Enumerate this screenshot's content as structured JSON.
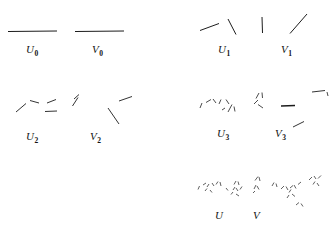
{
  "figure": {
    "title": "",
    "background_color": "#ffffff",
    "ink_color": "#1c1c1c",
    "width": 335,
    "height": 232
  },
  "panels": [
    {
      "id": "u0",
      "label": "U",
      "subscript": "0",
      "label_x": 26,
      "label_y": 44,
      "column": "left",
      "row": 0,
      "segment_count": 1,
      "segments": [
        {
          "x1": 8,
          "y1": 31.5,
          "x2": 57,
          "y2": 31.0,
          "w": 1.1
        }
      ]
    },
    {
      "id": "v0",
      "label": "V",
      "subscript": "0",
      "label_x": 92,
      "label_y": 44,
      "column": "left",
      "row": 0,
      "segment_count": 1,
      "segments": [
        {
          "x1": 75,
          "y1": 31.5,
          "x2": 124,
          "y2": 31.0,
          "w": 1.1
        }
      ]
    },
    {
      "id": "u1",
      "label": "U",
      "subscript": "1",
      "label_x": 218,
      "label_y": 44,
      "column": "right",
      "row": 0,
      "segment_count": 2,
      "segments": [
        {
          "x1": 200,
          "y1": 30.5,
          "x2": 219,
          "y2": 23.5,
          "w": 1.0
        },
        {
          "x1": 228,
          "y1": 19.0,
          "x2": 236,
          "y2": 34.5,
          "w": 1.0
        }
      ]
    },
    {
      "id": "v1",
      "label": "V",
      "subscript": "1",
      "label_x": 281,
      "label_y": 44,
      "column": "right",
      "row": 0,
      "segment_count": 2,
      "segments": [
        {
          "x1": 262,
          "y1": 17.0,
          "x2": 262.5,
          "y2": 33.0,
          "w": 1.0
        },
        {
          "x1": 290,
          "y1": 33.5,
          "x2": 307,
          "y2": 14.0,
          "w": 1.0
        }
      ]
    },
    {
      "id": "u2",
      "label": "U",
      "subscript": "2",
      "label_x": 26,
      "label_y": 131,
      "column": "left",
      "row": 1,
      "segment_count": 4,
      "segments": [
        {
          "x1": 16,
          "y1": 112.0,
          "x2": 26,
          "y2": 103.5,
          "w": 0.9
        },
        {
          "x1": 30,
          "y1": 100.5,
          "x2": 39,
          "y2": 103.0,
          "w": 0.9
        },
        {
          "x1": 47,
          "y1": 103.0,
          "x2": 56,
          "y2": 99.5,
          "w": 0.9
        },
        {
          "x1": 45,
          "y1": 111.5,
          "x2": 57,
          "y2": 111.0,
          "w": 0.9
        }
      ]
    },
    {
      "id": "v2",
      "label": "V",
      "subscript": "2",
      "label_x": 90,
      "label_y": 131,
      "column": "left",
      "row": 1,
      "segment_count": 4,
      "segments": [
        {
          "x1": 78,
          "y1": 97.5,
          "x2": 72.5,
          "y2": 106.0,
          "w": 0.9
        },
        {
          "x1": 74,
          "y1": 99.0,
          "x2": 79,
          "y2": 94.5,
          "w": 0.9
        },
        {
          "x1": 119,
          "y1": 101.0,
          "x2": 132,
          "y2": 96.5,
          "w": 0.9
        },
        {
          "x1": 108,
          "y1": 108.0,
          "x2": 119,
          "y2": 124.0,
          "w": 0.9
        }
      ]
    },
    {
      "id": "u3",
      "label": "U",
      "subscript": "3",
      "label_x": 217,
      "label_y": 128,
      "column": "right",
      "row": 1,
      "segment_count": 8,
      "segments": [
        {
          "x1": 200,
          "y1": 108.0,
          "x2": 202,
          "y2": 103.0,
          "w": 0.8
        },
        {
          "x1": 206,
          "y1": 102.5,
          "x2": 211,
          "y2": 99.5,
          "w": 0.8
        },
        {
          "x1": 213,
          "y1": 99.0,
          "x2": 216,
          "y2": 103.0,
          "w": 0.8
        },
        {
          "x1": 219,
          "y1": 104.0,
          "x2": 221,
          "y2": 99.5,
          "w": 0.8
        },
        {
          "x1": 226,
          "y1": 99.5,
          "x2": 229,
          "y2": 104.0,
          "w": 0.8
        },
        {
          "x1": 228,
          "y1": 112.0,
          "x2": 232,
          "y2": 104.5,
          "w": 0.8
        },
        {
          "x1": 234,
          "y1": 106.5,
          "x2": 235,
          "y2": 111.5,
          "w": 0.8
        },
        {
          "x1": 222,
          "y1": 110.0,
          "x2": 225,
          "y2": 108.0,
          "w": 0.8
        }
      ]
    },
    {
      "id": "v3",
      "label": "V",
      "subscript": "3",
      "label_x": 275,
      "label_y": 128,
      "column": "right",
      "row": 1,
      "segment_count": 8,
      "segments": [
        {
          "x1": 256,
          "y1": 98.5,
          "x2": 259,
          "y2": 93.0,
          "w": 0.8
        },
        {
          "x1": 262,
          "y1": 92.5,
          "x2": 262.5,
          "y2": 98.0,
          "w": 0.8
        },
        {
          "x1": 254,
          "y1": 104.0,
          "x2": 258,
          "y2": 100.0,
          "w": 0.8
        },
        {
          "x1": 258,
          "y1": 104.5,
          "x2": 263,
          "y2": 108.0,
          "w": 0.8
        },
        {
          "x1": 281,
          "y1": 106.0,
          "x2": 295,
          "y2": 105.5,
          "w": 1.3
        },
        {
          "x1": 312,
          "y1": 92.0,
          "x2": 325,
          "y2": 90.5,
          "w": 0.9
        },
        {
          "x1": 327,
          "y1": 92.0,
          "x2": 328,
          "y2": 96.0,
          "w": 0.8
        },
        {
          "x1": 293,
          "y1": 127.0,
          "x2": 304,
          "y2": 121.5,
          "w": 0.9
        }
      ]
    },
    {
      "id": "u",
      "label": "U",
      "subscript": "",
      "label_x": 215,
      "label_y": 210,
      "column": "right",
      "row": 2,
      "segment_count": 16,
      "segments": [
        {
          "x1": 198,
          "y1": 189.5,
          "x2": 199.5,
          "y2": 186.0,
          "w": 0.7
        },
        {
          "x1": 203,
          "y1": 185.0,
          "x2": 206,
          "y2": 183.0,
          "w": 0.7
        },
        {
          "x1": 207,
          "y1": 187.0,
          "x2": 209,
          "y2": 184.0,
          "w": 0.7
        },
        {
          "x1": 212,
          "y1": 183.0,
          "x2": 214,
          "y2": 186.0,
          "w": 0.7
        },
        {
          "x1": 216,
          "y1": 184.5,
          "x2": 218,
          "y2": 181.5,
          "w": 0.7
        },
        {
          "x1": 220,
          "y1": 182.0,
          "x2": 221,
          "y2": 186.0,
          "w": 0.7
        },
        {
          "x1": 205,
          "y1": 191.0,
          "x2": 207,
          "y2": 188.5,
          "w": 0.7
        },
        {
          "x1": 210,
          "y1": 190.0,
          "x2": 212,
          "y2": 192.5,
          "w": 0.7
        },
        {
          "x1": 234,
          "y1": 184.5,
          "x2": 236,
          "y2": 181.0,
          "w": 0.7
        },
        {
          "x1": 238,
          "y1": 181.5,
          "x2": 239,
          "y2": 185.0,
          "w": 0.7
        },
        {
          "x1": 233,
          "y1": 190.0,
          "x2": 235,
          "y2": 187.0,
          "w": 0.7
        },
        {
          "x1": 236,
          "y1": 188.0,
          "x2": 238,
          "y2": 191.0,
          "w": 0.7
        },
        {
          "x1": 240,
          "y1": 189.5,
          "x2": 242,
          "y2": 186.5,
          "w": 0.7
        },
        {
          "x1": 231,
          "y1": 194.5,
          "x2": 233,
          "y2": 192.0,
          "w": 0.7
        },
        {
          "x1": 236,
          "y1": 194.0,
          "x2": 239,
          "y2": 196.0,
          "w": 0.7
        },
        {
          "x1": 226,
          "y1": 188.0,
          "x2": 228,
          "y2": 190.5,
          "w": 0.7
        }
      ]
    },
    {
      "id": "v",
      "label": "V",
      "subscript": "",
      "label_x": 253,
      "label_y": 210,
      "column": "right",
      "row": 2,
      "segment_count": 22,
      "segments": [
        {
          "x1": 255,
          "y1": 180.5,
          "x2": 258,
          "y2": 176.5,
          "w": 0.7
        },
        {
          "x1": 259,
          "y1": 177.0,
          "x2": 260,
          "y2": 181.0,
          "w": 0.7
        },
        {
          "x1": 254,
          "y1": 189.0,
          "x2": 256,
          "y2": 185.0,
          "w": 0.7
        },
        {
          "x1": 257,
          "y1": 186.0,
          "x2": 259,
          "y2": 189.5,
          "w": 0.7
        },
        {
          "x1": 253,
          "y1": 193.0,
          "x2": 255,
          "y2": 191.0,
          "w": 0.7
        },
        {
          "x1": 272,
          "y1": 186.0,
          "x2": 274,
          "y2": 182.5,
          "w": 0.7
        },
        {
          "x1": 276,
          "y1": 183.5,
          "x2": 277,
          "y2": 187.0,
          "w": 0.7
        },
        {
          "x1": 281,
          "y1": 189.0,
          "x2": 284,
          "y2": 186.0,
          "w": 0.7
        },
        {
          "x1": 286,
          "y1": 186.5,
          "x2": 288,
          "y2": 190.0,
          "w": 0.7
        },
        {
          "x1": 290,
          "y1": 188.0,
          "x2": 293,
          "y2": 185.5,
          "w": 0.7
        },
        {
          "x1": 294,
          "y1": 185.0,
          "x2": 296,
          "y2": 188.5,
          "w": 0.7
        },
        {
          "x1": 298,
          "y1": 184.5,
          "x2": 301,
          "y2": 182.0,
          "w": 0.7
        },
        {
          "x1": 289,
          "y1": 192.5,
          "x2": 291,
          "y2": 189.5,
          "w": 0.7
        },
        {
          "x1": 292,
          "y1": 194.0,
          "x2": 295,
          "y2": 196.5,
          "w": 0.7
        },
        {
          "x1": 287,
          "y1": 198.0,
          "x2": 289,
          "y2": 195.0,
          "w": 0.7
        },
        {
          "x1": 309,
          "y1": 180.0,
          "x2": 312,
          "y2": 177.0,
          "w": 0.7
        },
        {
          "x1": 314,
          "y1": 176.0,
          "x2": 316,
          "y2": 179.0,
          "w": 0.7
        },
        {
          "x1": 318,
          "y1": 178.5,
          "x2": 321,
          "y2": 175.5,
          "w": 0.7
        },
        {
          "x1": 313,
          "y1": 184.5,
          "x2": 315,
          "y2": 181.5,
          "w": 0.7
        },
        {
          "x1": 317,
          "y1": 183.0,
          "x2": 319,
          "y2": 186.0,
          "w": 0.7
        },
        {
          "x1": 296,
          "y1": 205.0,
          "x2": 299,
          "y2": 202.5,
          "w": 0.7
        },
        {
          "x1": 301,
          "y1": 203.5,
          "x2": 303,
          "y2": 206.5,
          "w": 0.7
        }
      ]
    }
  ]
}
